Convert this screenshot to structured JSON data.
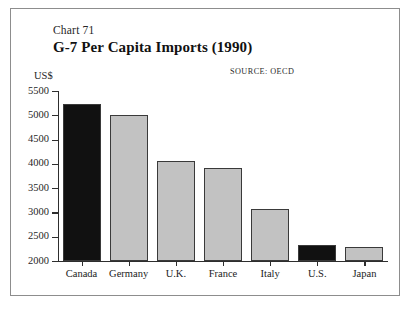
{
  "figure": {
    "chart_number": "Chart 71",
    "title": "G-7 Per Capita Imports (1990)",
    "source_note": "SOURCE:  OECD",
    "unit_label": "US$"
  },
  "colors": {
    "highlight_bar": "#111111",
    "normal_bar": "#c2c2c2",
    "bar_outline": "#3a3a3a",
    "axis": "#2e2e2e",
    "frame": "#8d8d8d",
    "text": "#1a1a1a"
  },
  "chart_data": {
    "type": "bar",
    "title": "G-7 Per Capita Imports (1990)",
    "subtitle": "Chart 71",
    "xlabel": "",
    "ylabel": "US$",
    "ylim": [
      2000,
      5500
    ],
    "yticks": [
      2000,
      2500,
      3000,
      3500,
      4000,
      4500,
      5000,
      5500
    ],
    "ytick_labels": [
      "2000",
      "2500",
      "3000",
      "3500",
      "4000",
      "4500",
      "5000",
      "5500"
    ],
    "grid": false,
    "legend": false,
    "source": "OECD",
    "categories": [
      "Canada",
      "Germany",
      "U.K.",
      "France",
      "Italy",
      "U.S.",
      "Japan"
    ],
    "values": [
      5230,
      5000,
      4050,
      3920,
      3080,
      2330,
      2290
    ],
    "bar_styles": [
      "black",
      "gray",
      "gray",
      "gray",
      "gray",
      "black",
      "gray"
    ]
  }
}
